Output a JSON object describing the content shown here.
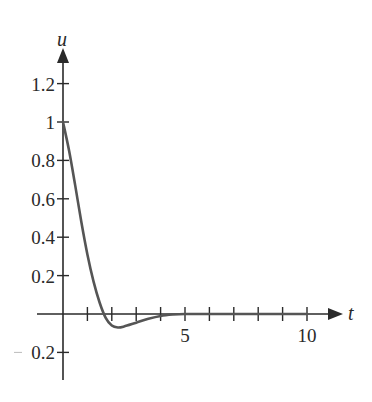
{
  "chart_data": {
    "type": "line",
    "title": "",
    "xlabel": "t",
    "ylabel": "u",
    "xlim": [
      0,
      11.5
    ],
    "ylim": [
      -0.3,
      1.4
    ],
    "grid": false,
    "legend": null,
    "x_ticks": [
      1,
      2,
      3,
      4,
      5,
      6,
      7,
      8,
      9,
      10
    ],
    "x_tick_labels": [
      {
        "value": 5,
        "label": "5"
      },
      {
        "value": 10,
        "label": "10"
      }
    ],
    "y_ticks": [
      -0.2,
      0.2,
      0.4,
      0.6,
      0.8,
      1,
      1.2
    ],
    "y_tick_labels": [
      {
        "value": 1.2,
        "label": "1.2"
      },
      {
        "value": 1,
        "label": "1"
      },
      {
        "value": 0.8,
        "label": "0.8"
      },
      {
        "value": 0.6,
        "label": "0.6"
      },
      {
        "value": 0.4,
        "label": "0.4"
      },
      {
        "value": 0.2,
        "label": "0.2"
      },
      {
        "value": -0.2,
        "label": "0.2"
      }
    ],
    "series": [
      {
        "name": "u(t)",
        "x": [
          0,
          0.25,
          0.5,
          0.75,
          1.0,
          1.25,
          1.5,
          1.75,
          2.0,
          2.25,
          2.5,
          3.0,
          3.5,
          4.0,
          4.5,
          5.0,
          6.0,
          7.0,
          8.0,
          9.0,
          10.0
        ],
        "y": [
          1.0,
          0.85,
          0.67,
          0.48,
          0.31,
          0.17,
          0.06,
          -0.02,
          -0.06,
          -0.07,
          -0.065,
          -0.045,
          -0.025,
          -0.01,
          -0.003,
          0.0,
          0.0,
          0.0,
          0.0,
          0.0,
          0.0
        ]
      }
    ]
  }
}
